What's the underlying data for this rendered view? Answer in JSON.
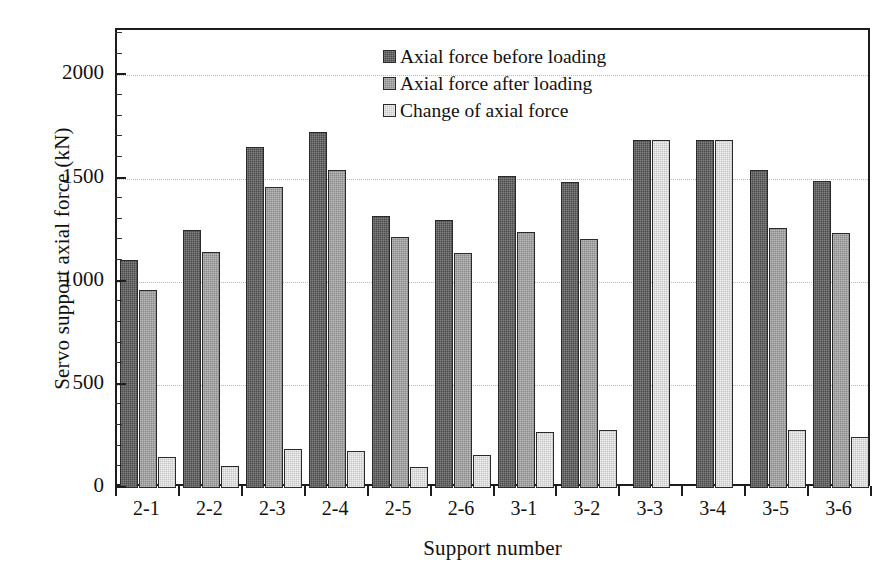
{
  "chart_data": {
    "type": "bar",
    "title": "",
    "xlabel": "Support number",
    "ylabel": "Servo support axial force (kN)",
    "ylim": [
      0,
      2220
    ],
    "yticks": [
      0,
      500,
      1000,
      1500,
      2000
    ],
    "ytick_labels": [
      "0",
      "500",
      "1000",
      "1500",
      "2000"
    ],
    "y_minor_tick_step": 100,
    "grid": "horizontal-dotted",
    "legend_position": "top-center",
    "categories": [
      "2-1",
      "2-2",
      "2-3",
      "2-4",
      "2-5",
      "2-6",
      "3-1",
      "3-2",
      "3-3",
      "3-4",
      "3-5",
      "3-6"
    ],
    "series": [
      {
        "name": "Axial force before loading",
        "color": "#4a4a4a",
        "values": [
          1105,
          1250,
          1655,
          1725,
          1320,
          1300,
          1510,
          1485,
          1685,
          1685,
          1540,
          1490
        ]
      },
      {
        "name": "Axial force after loading",
        "color": "#8a8a8a",
        "values": [
          960,
          1145,
          1460,
          1540,
          1215,
          1140,
          1240,
          1205,
          null,
          null,
          1260,
          1235
        ]
      },
      {
        "name": "Change of axial force",
        "color": "#c4c4c4",
        "values": [
          150,
          105,
          190,
          180,
          100,
          160,
          270,
          280,
          1685,
          1685,
          280,
          245
        ]
      }
    ]
  },
  "legend": {
    "items": [
      {
        "label": "Axial force before loading",
        "swatch": "#4a4a4a"
      },
      {
        "label": "Axial force after loading",
        "swatch": "#8a8a8a"
      },
      {
        "label": "Change of axial force",
        "swatch": "#c4c4c4"
      }
    ]
  },
  "axes": {
    "y_title": "Servo support axial force (kN)",
    "x_title": "Support number"
  }
}
